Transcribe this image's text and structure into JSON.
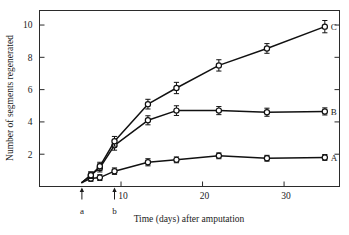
{
  "chart_data": {
    "type": "line",
    "title": "",
    "xlabel": "Time (days) after amputation",
    "ylabel": "Number of segments regenerated",
    "xlim": [
      0,
      36.8
    ],
    "ylim": [
      0,
      10.9
    ],
    "xticks": [
      10,
      20,
      30
    ],
    "yticks": [
      2,
      4,
      6,
      8,
      10
    ],
    "grid": false,
    "legend_position": "right-of-curve-ends",
    "error_bars": true,
    "series": [
      {
        "name": "A",
        "label": "A",
        "x": [
          5.2,
          6.3,
          7.4,
          9.2,
          13.3,
          16.8,
          22.0,
          27.9,
          35.0
        ],
        "y": [
          0.25,
          0.5,
          0.55,
          0.95,
          1.5,
          1.65,
          1.9,
          1.75,
          1.8
        ],
        "yerr": [
          0.0,
          0.18,
          0.18,
          0.2,
          0.22,
          0.18,
          0.18,
          0.18,
          0.18
        ]
      },
      {
        "name": "B",
        "label": "B",
        "x": [
          5.2,
          6.3,
          7.4,
          9.2,
          13.3,
          16.8,
          22.0,
          27.9,
          35.0
        ],
        "y": [
          0.25,
          0.7,
          1.15,
          2.55,
          4.1,
          4.7,
          4.7,
          4.6,
          4.65
        ],
        "yerr": [
          0.0,
          0.2,
          0.25,
          0.3,
          0.28,
          0.3,
          0.25,
          0.25,
          0.22
        ]
      },
      {
        "name": "C",
        "label": "C",
        "x": [
          5.2,
          6.3,
          7.4,
          9.2,
          13.3,
          16.8,
          22.0,
          27.9,
          35.0
        ],
        "y": [
          0.25,
          0.7,
          1.25,
          2.8,
          5.1,
          6.1,
          7.5,
          8.55,
          9.9
        ],
        "yerr": [
          0.0,
          0.2,
          0.25,
          0.3,
          0.3,
          0.35,
          0.35,
          0.3,
          0.38
        ]
      }
    ],
    "annotations": [
      {
        "name": "a",
        "label": "a",
        "x": 5.2,
        "type": "up-arrow-below-axis"
      },
      {
        "name": "b",
        "label": "b",
        "x": 9.2,
        "type": "up-arrow-below-axis"
      }
    ]
  },
  "axis": {
    "x_tick_labels": [
      "10",
      "20",
      "30"
    ],
    "y_tick_labels": [
      "2",
      "4",
      "6",
      "8",
      "10"
    ],
    "x_title": "Time (days) after amputation",
    "y_title": "Number of segments regenerated"
  },
  "series_labels": {
    "a_label": "A",
    "b_label": "B",
    "c_label": "C"
  },
  "annotation_labels": {
    "a": "a",
    "b": "b"
  },
  "colors": {
    "line": "#111111",
    "frame": "#2b2b2b",
    "marker_fill": "#ffffff",
    "background": "#ffffff",
    "text": "#1a1a1a"
  }
}
